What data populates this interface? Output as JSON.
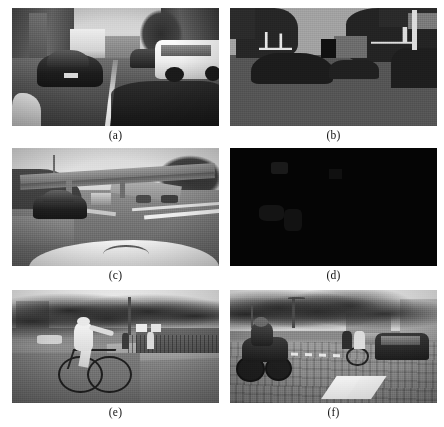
{
  "figure": {
    "layout": {
      "rows": 3,
      "columns": 2,
      "total_panels": 6
    },
    "panels": [
      {
        "id": "a",
        "caption": "(a)",
        "position": "row1-left",
        "kind": "photograph",
        "description": "Grayscale urban street scene: dark sedan in left lane, white SUV on right, box truck ahead, buildings on both sides",
        "palette": {
          "sky": "#d8d8d8",
          "road": "#555555",
          "highlight": "#fbfbfb",
          "shadow": "#141414"
        }
      },
      {
        "id": "b",
        "caption": "(b)",
        "position": "row1-right",
        "kind": "segmentation-map",
        "description": "Segmentation / label map of panel (a): mid-gray sky and road regions with near-black object blobs and bright white structures",
        "palette": {
          "sky": "#a2a2a2",
          "ground": "#555555",
          "object": "#232323",
          "structure": "#e6e6e6"
        }
      },
      {
        "id": "c",
        "caption": "(c)",
        "position": "row2-left",
        "kind": "photograph",
        "description": "Grayscale highway scene viewed over a white car hood, concrete overpass bridge crossing ahead, dark car in left lane, lane markings on the right",
        "palette": {
          "sky": "#e2e2e2",
          "road": "#767676",
          "bridge": "#9c9c9c",
          "hood": "#f2f2f2"
        }
      },
      {
        "id": "d",
        "caption": "(d)",
        "position": "row2-right",
        "kind": "blank-black-frame",
        "description": "Almost entirely black frame with barely visible dark-gray shapes",
        "palette": {
          "background": "#050505",
          "faint_shape": "#1a1a1a"
        }
      },
      {
        "id": "e",
        "caption": "(e)",
        "position": "row3-left",
        "kind": "photograph",
        "description": "Grayscale park street: cyclist in light clothing riding left-to-right, leafy trees behind, pedestrians and signs near a fence on the right",
        "palette": {
          "sky": "#f0f0f0",
          "foliage": "#2e2e2e",
          "ground": "#7c7c7c",
          "rider": "#f4f4f4"
        }
      },
      {
        "id": "f",
        "caption": "(f)",
        "position": "row3-right",
        "kind": "photograph",
        "description": "Grayscale city street: motorcyclist at left on cobbled road, cyclists mid-scene, dark car at right, crosswalk stripes in the foreground",
        "palette": {
          "sky": "#efefef, ",
          "road": "#838383",
          "crosswalk": "#f0f0f0",
          "vehicle": "#1d1d1d"
        }
      }
    ]
  }
}
